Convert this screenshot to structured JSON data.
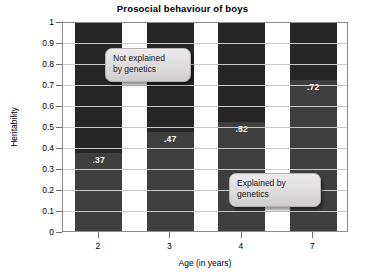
{
  "chart_data": {
    "type": "bar",
    "subtype": "stacked-bar",
    "title": "Prosocial behaviour of boys",
    "xlabel": "Age (in years)",
    "ylabel": "Heritability",
    "categories": [
      "2",
      "3",
      "4",
      "7"
    ],
    "values": [
      0.37,
      0.47,
      0.52,
      0.72
    ],
    "value_labels": [
      ".37",
      ".47",
      ".52",
      ".72"
    ],
    "ylim": [
      0,
      1
    ],
    "ytick_labels": [
      "1",
      "0.9",
      "0.8",
      "0.7",
      "0.6",
      "0.5",
      "0.4",
      "0.3",
      "0.2",
      "0.1",
      "0"
    ],
    "ytick_values": [
      1,
      0.9,
      0.8,
      0.7,
      0.6,
      0.5,
      0.4,
      0.3,
      0.2,
      0.1,
      0
    ],
    "grid": true,
    "legend": "none",
    "series": [
      {
        "name": "Explained by genetics",
        "values": [
          0.37,
          0.47,
          0.52,
          0.72
        ],
        "color": "#3f3f3f"
      },
      {
        "name": "Not explained by genetics",
        "values": [
          0.63,
          0.53,
          0.48,
          0.28
        ],
        "color": "#262626"
      }
    ],
    "annotations": [
      {
        "id": "not-explained",
        "text": "Not explained\nby genetics"
      },
      {
        "id": "explained",
        "text": "Explained by\ngenetics"
      }
    ]
  },
  "colors": {
    "segment_top": "#262626",
    "segment_bottom": "#3f3f3f",
    "gridline": "#c9c9c9",
    "axis": "#8b8b8b",
    "value_text": "#ffffff",
    "callout_bg": "#dddbdb",
    "callout_border": "#b4b2b2"
  }
}
